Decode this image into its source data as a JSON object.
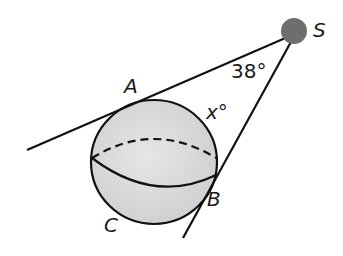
{
  "diagram": {
    "type": "geometry",
    "labels": {
      "S": "S",
      "A": "A",
      "B": "B",
      "C": "C",
      "angle_S": "38°",
      "arc_x": "x°"
    },
    "colors": {
      "stroke": "#111111",
      "sphere_fill": "#d9d9d9",
      "point_S": "#6e6e6e"
    }
  }
}
